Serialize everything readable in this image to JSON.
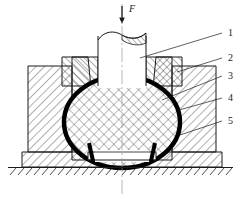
{
  "figure": {
    "type": "engineering-cross-section",
    "title": "",
    "force_label": "F",
    "background_color": "#ffffff",
    "line_color": "#1a1a1a",
    "seal_color": "#000000",
    "callouts": [
      {
        "id": "1",
        "label": "1",
        "text_x": 228,
        "text_y": 36,
        "leader_from_x": 222,
        "leader_from_y": 33,
        "leader_to_x": 140,
        "leader_to_y": 58
      },
      {
        "id": "2",
        "label": "2",
        "text_x": 228,
        "text_y": 61,
        "leader_from_x": 222,
        "leader_from_y": 58,
        "leader_to_x": 177,
        "leader_to_y": 72
      },
      {
        "id": "3",
        "label": "3",
        "text_x": 228,
        "text_y": 79,
        "leader_from_x": 222,
        "leader_from_y": 76,
        "leader_to_x": 162,
        "leader_to_y": 100
      },
      {
        "id": "4",
        "label": "4",
        "text_x": 228,
        "text_y": 101,
        "leader_from_x": 222,
        "leader_from_y": 98,
        "leader_to_x": 179,
        "leader_to_y": 110
      },
      {
        "id": "5",
        "label": "5",
        "text_x": 228,
        "text_y": 124,
        "leader_from_x": 222,
        "leader_from_y": 121,
        "leader_to_x": 180,
        "leader_to_y": 135
      }
    ],
    "parts": [
      {
        "ref": "1",
        "name": "punch"
      },
      {
        "ref": "2",
        "name": "upper-die-insert"
      },
      {
        "ref": "3",
        "name": "workpiece-billet"
      },
      {
        "ref": "4",
        "name": "die-insert"
      },
      {
        "ref": "5",
        "name": "die-container-ring"
      }
    ],
    "geometry": {
      "centerline_x": 122,
      "punch_left_x": 98,
      "punch_right_x": 146,
      "punch_top_y": 32,
      "punch_bottom_y": 85,
      "break_line_y": 36,
      "ball_center_x": 122,
      "ball_center_y": 122,
      "ball_radius_x": 61,
      "ball_radius_y": 48,
      "ground_line_y": 168,
      "ground_left_x": 8,
      "ground_right_x": 233,
      "base_left_x": 22,
      "base_right_x": 222
    }
  }
}
